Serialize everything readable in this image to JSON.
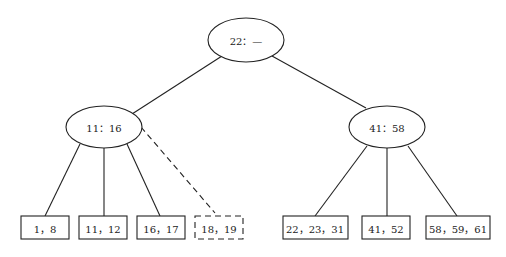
{
  "diagram": {
    "type": "tree",
    "root": {
      "label": "22：—"
    },
    "internal": [
      {
        "label": "11：16"
      },
      {
        "label": "41：58"
      }
    ],
    "leaves": [
      {
        "label": "1，8",
        "dashed": false
      },
      {
        "label": "11，12",
        "dashed": false
      },
      {
        "label": "16，17",
        "dashed": false
      },
      {
        "label": "18，19",
        "dashed": true
      },
      {
        "label": "22，23，31",
        "dashed": false
      },
      {
        "label": "41，52",
        "dashed": false
      },
      {
        "label": "58，59，61",
        "dashed": false
      }
    ]
  }
}
